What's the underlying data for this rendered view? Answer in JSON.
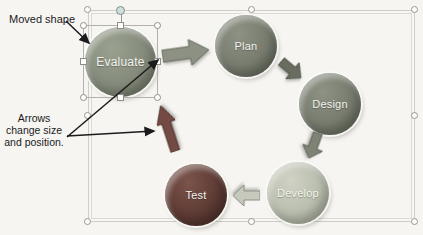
{
  "annotations": {
    "moved_shape_label": "Moved shape",
    "arrows_note_lines": [
      "Arrows",
      "change size",
      "and position."
    ]
  },
  "diagram": {
    "type": "cycle",
    "nodes": [
      {
        "label": "Evaluate",
        "color": "#848a7b",
        "selected": true
      },
      {
        "label": "Plan",
        "color": "#767b6e",
        "selected": false
      },
      {
        "label": "Design",
        "color": "#767b6e",
        "selected": false
      },
      {
        "label": "Develop",
        "color": "#b9bdae",
        "selected": false
      },
      {
        "label": "Test",
        "color": "#5c3a33",
        "selected": false
      }
    ],
    "connectors": [
      {
        "from": "Evaluate",
        "to": "Plan",
        "color": "#8c9184"
      },
      {
        "from": "Plan",
        "to": "Design",
        "color": "#686d60"
      },
      {
        "from": "Design",
        "to": "Develop",
        "color": "#7e8376"
      },
      {
        "from": "Develop",
        "to": "Test",
        "color": "#c6c9bc"
      },
      {
        "from": "Test",
        "to": "Evaluate",
        "color": "#744b44"
      }
    ],
    "canvas_border_color": "#cfcdc7",
    "callout_color": "#1b1b1b"
  }
}
